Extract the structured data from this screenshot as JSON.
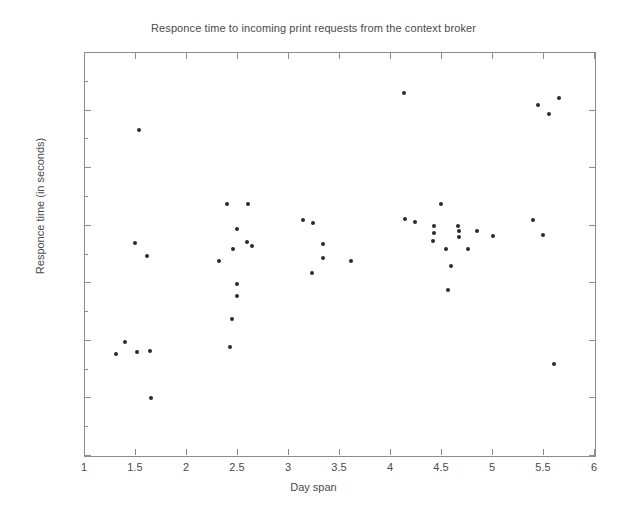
{
  "chart_data": {
    "type": "scatter",
    "title": "Responce time to incoming print requests from the context broker",
    "xlabel": "Day span",
    "ylabel": "Responce time (in seconds)",
    "xlim": [
      1,
      6
    ],
    "ylim": [
      0.45,
      0.8
    ],
    "grid": false,
    "legend": null,
    "marker": "filled-circle",
    "marker_color": "#2b2b2b",
    "xticks": [
      1,
      1.5,
      2,
      2.5,
      3,
      3.5,
      4,
      4.5,
      5,
      5.5,
      6
    ],
    "xtick_labels": [
      "1",
      "1.5",
      "2",
      "2.5",
      "3",
      "3.5",
      "4",
      "4.5",
      "5",
      "5.5",
      "6"
    ],
    "yticks": [
      0.45,
      0.5,
      0.55,
      0.6,
      0.65,
      0.7,
      0.75,
      0.8
    ],
    "ytick_labels": [
      "0.45",
      "0.5",
      "0.55",
      "0.6",
      "0.65",
      "0.7",
      "0.75",
      "0.8"
    ],
    "points": [
      {
        "x": 1.3,
        "y": 0.539
      },
      {
        "x": 1.39,
        "y": 0.549
      },
      {
        "x": 1.51,
        "y": 0.54
      },
      {
        "x": 1.64,
        "y": 0.541
      },
      {
        "x": 1.53,
        "y": 0.733
      },
      {
        "x": 1.49,
        "y": 0.635
      },
      {
        "x": 1.61,
        "y": 0.624
      },
      {
        "x": 1.65,
        "y": 0.5
      },
      {
        "x": 2.39,
        "y": 0.669
      },
      {
        "x": 2.6,
        "y": 0.669
      },
      {
        "x": 2.49,
        "y": 0.647
      },
      {
        "x": 2.59,
        "y": 0.636
      },
      {
        "x": 2.64,
        "y": 0.632
      },
      {
        "x": 2.45,
        "y": 0.63
      },
      {
        "x": 2.31,
        "y": 0.619
      },
      {
        "x": 2.49,
        "y": 0.599
      },
      {
        "x": 2.49,
        "y": 0.589
      },
      {
        "x": 2.44,
        "y": 0.569
      },
      {
        "x": 2.42,
        "y": 0.545
      },
      {
        "x": 3.14,
        "y": 0.655
      },
      {
        "x": 3.24,
        "y": 0.652
      },
      {
        "x": 3.33,
        "y": 0.634
      },
      {
        "x": 3.33,
        "y": 0.622
      },
      {
        "x": 3.61,
        "y": 0.619
      },
      {
        "x": 3.23,
        "y": 0.609
      },
      {
        "x": 4.13,
        "y": 0.765
      },
      {
        "x": 4.14,
        "y": 0.656
      },
      {
        "x": 4.24,
        "y": 0.653
      },
      {
        "x": 4.49,
        "y": 0.669
      },
      {
        "x": 4.42,
        "y": 0.65
      },
      {
        "x": 4.84,
        "y": 0.645
      },
      {
        "x": 4.66,
        "y": 0.65
      },
      {
        "x": 4.67,
        "y": 0.645
      },
      {
        "x": 4.67,
        "y": 0.64
      },
      {
        "x": 4.42,
        "y": 0.644
      },
      {
        "x": 4.41,
        "y": 0.637
      },
      {
        "x": 4.54,
        "y": 0.63
      },
      {
        "x": 4.59,
        "y": 0.615
      },
      {
        "x": 4.56,
        "y": 0.594
      },
      {
        "x": 4.75,
        "y": 0.63
      },
      {
        "x": 5.0,
        "y": 0.641
      },
      {
        "x": 5.39,
        "y": 0.655
      },
      {
        "x": 5.49,
        "y": 0.642
      },
      {
        "x": 5.44,
        "y": 0.755
      },
      {
        "x": 5.65,
        "y": 0.761
      },
      {
        "x": 5.55,
        "y": 0.747
      },
      {
        "x": 5.6,
        "y": 0.53
      }
    ]
  }
}
